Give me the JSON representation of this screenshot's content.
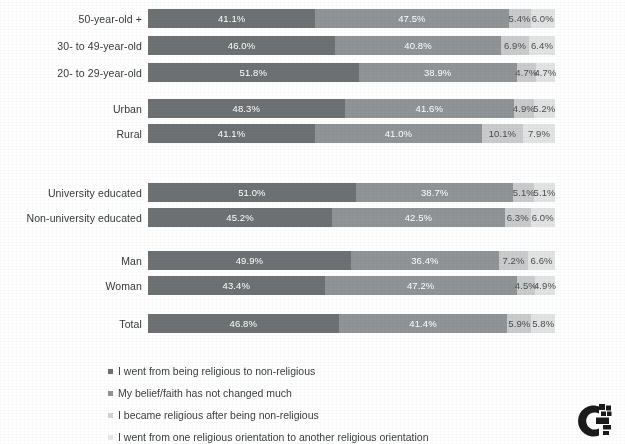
{
  "chart_data": {
    "type": "bar",
    "orientation": "horizontal",
    "stacked": true,
    "stack_normalized": true,
    "title": "",
    "subtitle": "",
    "xlabel": "",
    "ylabel": "",
    "xlim": [
      0,
      100
    ],
    "grid": false,
    "legend_position": "bottom-left",
    "value_suffix": "%",
    "categories": [
      "50-year-old +",
      "30- to 49-year-old",
      "20- to 29-year-old",
      "Urban",
      "Rural",
      "University educated",
      "Non-university educated",
      "Man",
      "Woman",
      "Total"
    ],
    "series": [
      {
        "name": "I went from being religious to non-religious",
        "color": "#6e7173",
        "values": [
          41.1,
          46.0,
          51.8,
          48.3,
          41.1,
          51.0,
          45.2,
          49.9,
          43.4,
          46.8
        ]
      },
      {
        "name": "My belief/faith has not changed much",
        "color": "#909496",
        "values": [
          47.5,
          40.8,
          38.9,
          41.6,
          41.0,
          38.7,
          42.5,
          36.4,
          47.2,
          41.4
        ]
      },
      {
        "name": "I became religious after being non-religious",
        "color": "#c9cbcc",
        "values": [
          5.4,
          6.9,
          4.7,
          4.9,
          10.1,
          5.1,
          6.3,
          7.2,
          4.5,
          5.9
        ]
      },
      {
        "name": "I went from one religious orientation to another religious orientation",
        "color": "#e2e4e4",
        "values": [
          6.0,
          6.4,
          4.7,
          5.2,
          7.9,
          5.1,
          6.0,
          6.6,
          4.9,
          5.8
        ]
      }
    ],
    "data_labels": [
      [
        "41.1%",
        "47.5%",
        "5.4%",
        "6.0%"
      ],
      [
        "46.0%",
        "40.8%",
        "6.9%",
        "6.4%"
      ],
      [
        "51.8%",
        "38.9%",
        "4.7%",
        "4.7%"
      ],
      [
        "48.3%",
        "41.6%",
        "4.9%",
        "5.2%"
      ],
      [
        "41.1%",
        "41.0%",
        "10.1%",
        "7.9%"
      ],
      [
        "51.0%",
        "38.7%",
        "5.1%",
        "5.1%"
      ],
      [
        "45.2%",
        "42.5%",
        "6.3%",
        "6.0%"
      ],
      [
        "49.9%",
        "36.4%",
        "7.2%",
        "6.6%"
      ],
      [
        "43.4%",
        "47.2%",
        "4.5%",
        "4.9%"
      ],
      [
        "46.8%",
        "41.4%",
        "5.9%",
        "5.8%"
      ]
    ]
  },
  "rows": [
    {
      "label": "50-year-old +",
      "top": 9,
      "labels": [
        "41.1%",
        "47.5%",
        "5.4%",
        "6.0%"
      ],
      "values": [
        41.1,
        47.5,
        5.4,
        6.0
      ]
    },
    {
      "label": "30- to 49-year-old",
      "top": 36,
      "labels": [
        "46.0%",
        "40.8%",
        "6.9%",
        "6.4%"
      ],
      "values": [
        46.0,
        40.8,
        6.9,
        6.4
      ]
    },
    {
      "label": "20- to 29-year-old",
      "top": 63,
      "labels": [
        "51.8%",
        "38.9%",
        "4.7%",
        "4.7%"
      ],
      "values": [
        51.8,
        38.9,
        4.7,
        4.7
      ]
    },
    {
      "label": "Urban",
      "top": 99,
      "labels": [
        "48.3%",
        "41.6%",
        "4.9%",
        "5.2%"
      ],
      "values": [
        48.3,
        41.6,
        4.9,
        5.2
      ]
    },
    {
      "label": "Rural",
      "top": 124,
      "labels": [
        "41.1%",
        "41.0%",
        "10.1%",
        "7.9%"
      ],
      "values": [
        41.1,
        41.0,
        10.1,
        7.9
      ]
    },
    {
      "label": "University educated",
      "top": 183,
      "labels": [
        "51.0%",
        "38.7%",
        "5.1%",
        "5.1%"
      ],
      "values": [
        51.0,
        38.7,
        5.1,
        5.1
      ]
    },
    {
      "label": "Non-university educated",
      "top": 208,
      "labels": [
        "45.2%",
        "42.5%",
        "6.3%",
        "6.0%"
      ],
      "values": [
        45.2,
        42.5,
        6.3,
        6.0
      ]
    },
    {
      "label": "Man",
      "top": 251,
      "labels": [
        "49.9%",
        "36.4%",
        "7.2%",
        "6.6%"
      ],
      "values": [
        49.9,
        36.4,
        7.2,
        6.6
      ]
    },
    {
      "label": "Woman",
      "top": 276,
      "labels": [
        "43.4%",
        "47.2%",
        "4.5%",
        "4.9%"
      ],
      "values": [
        43.4,
        47.2,
        4.5,
        4.9
      ]
    },
    {
      "label": "Total",
      "top": 314,
      "labels": [
        "46.8%",
        "41.4%",
        "5.9%",
        "5.8%"
      ],
      "values": [
        46.8,
        41.4,
        5.9,
        5.8
      ]
    }
  ],
  "legend": {
    "items": [
      {
        "label": "I went from being religious to non-religious",
        "color": "#6e7173"
      },
      {
        "label": "My belief/faith has not changed much",
        "color": "#909496"
      },
      {
        "label": "I became religious after being non-religious",
        "color": "#c9cbcc"
      },
      {
        "label": "I went from one religious orientation to another religious orientation",
        "color": "#e2e4e4"
      }
    ]
  },
  "branding": {
    "logo_name": "g-mark-logo"
  }
}
